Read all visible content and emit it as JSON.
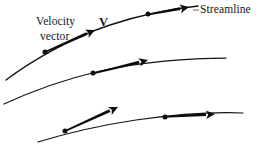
{
  "figure": {
    "background_color": "#ffffff",
    "ink_color": "#121212",
    "width": 269,
    "height": 149,
    "labels": {
      "velocity": "Velocity",
      "vector": "vector",
      "v_symbol": "V",
      "streamline": "Streamline"
    }
  },
  "chart_data": {
    "type": "diagram",
    "xlabel": "",
    "ylabel": "",
    "grid": false,
    "legend": "none",
    "annotations": [
      {
        "name": "velocity-label",
        "text": "Velocity",
        "x": 36,
        "y": 16
      },
      {
        "name": "vector-label",
        "text": "vector",
        "x": 40,
        "y": 31
      },
      {
        "name": "v-symbol-label",
        "text": "V",
        "x": 99,
        "y": 16,
        "bold": true
      },
      {
        "name": "streamline-label",
        "text": "Streamline",
        "x": 200,
        "y": 4
      }
    ],
    "streamlines": [
      {
        "name": "streamline-top",
        "path": "M 6 80 C 30 62 70 38 110 25 C 140 15 170 9 198 6",
        "stroke_width": 1.35,
        "points": [
          {
            "x": 45,
            "y": 52
          },
          {
            "x": 148,
            "y": 14
          }
        ],
        "vectors": [
          {
            "name": "velocity-vector-top-left",
            "tail_x": 43,
            "tail_y": 53,
            "tip_x": 95,
            "tip_y": 30,
            "thickness": 3.0
          },
          {
            "name": "velocity-vector-top-right",
            "tail_x": 146,
            "tail_y": 15,
            "tip_x": 189,
            "tip_y": 7,
            "thickness": 3.0
          }
        ]
      },
      {
        "name": "streamline-middle",
        "path": "M 4 104 C 30 92 62 80 100 71 C 140 62 190 58 226 58",
        "stroke_width": 1.25,
        "points": [
          {
            "x": 93,
            "y": 73
          }
        ],
        "vectors": [
          {
            "name": "velocity-vector-middle",
            "tail_x": 91,
            "tail_y": 74,
            "tip_x": 148,
            "tip_y": 60,
            "thickness": 3.0
          }
        ]
      },
      {
        "name": "streamline-bottom",
        "path": "M 38 142 C 64 134 96 126 136 120 C 178 114 218 112 243 113",
        "stroke_width": 1.25,
        "points": [
          {
            "x": 65,
            "y": 131
          },
          {
            "x": 165,
            "y": 117
          }
        ],
        "vectors": [
          {
            "name": "velocity-vector-bottom-left",
            "tail_x": 63,
            "tail_y": 132,
            "tip_x": 118,
            "tip_y": 107,
            "thickness": 3.0
          },
          {
            "name": "velocity-vector-bottom-right",
            "tail_x": 164,
            "tail_y": 117,
            "tip_x": 215,
            "tip_y": 114,
            "thickness": 3.0
          }
        ]
      }
    ],
    "leader_lines": [
      {
        "name": "streamline-leader",
        "x1": 193,
        "y1": 10,
        "x2": 199,
        "y2": 10
      }
    ]
  }
}
